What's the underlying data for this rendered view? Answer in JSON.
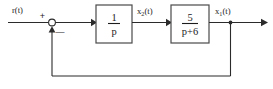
{
  "diagram": {
    "type": "control-system-block-diagram",
    "ink_color": "#2b2b2b",
    "block_border_color": "#4a4a4a",
    "background_color": "#ffffff"
  },
  "signals": {
    "input": {
      "name": "r",
      "label_base": "r(t)",
      "var": "r",
      "arg": "(t)"
    },
    "intermediate": {
      "name": "x2",
      "var": "x",
      "subscript": "2",
      "arg": "(t)"
    },
    "output": {
      "name": "x1",
      "var": "x",
      "subscript": "1",
      "arg": "(t)"
    }
  },
  "summing_junction": {
    "name": "summing-junction",
    "plus_sign": "+",
    "minus_sign": "—",
    "plus_input": "r(t)",
    "minus_input": "x1(t)"
  },
  "blocks": [
    {
      "id": "integrator",
      "name": "transfer-function-block-1",
      "numerator": "1",
      "denominator": "p",
      "transfer_function": "1/p"
    },
    {
      "id": "first-order-lag",
      "name": "transfer-function-block-2",
      "numerator": "5",
      "denominator": "p+6",
      "transfer_function": "5/(p+6)"
    }
  ],
  "feedback": {
    "name": "feedback-path",
    "tap_signal": "x1(t)",
    "polarity": "negative"
  }
}
